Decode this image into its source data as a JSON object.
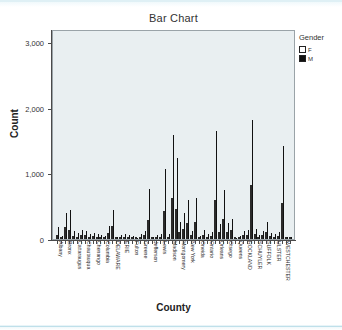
{
  "chart_data": {
    "type": "bar",
    "title": "Bar Chart",
    "xlabel": "County",
    "ylabel": "Count",
    "ylim": [
      0,
      3200
    ],
    "yticks": [
      "0",
      "1,000",
      "2,000",
      "3,000"
    ],
    "ytick_values": [
      0,
      1000,
      2000,
      3000
    ],
    "grid": false,
    "legend": {
      "title": "Gender",
      "position": "right",
      "entries": [
        {
          "label": "F",
          "color": "#ffffff"
        },
        {
          "label": "M",
          "color": "#111111"
        }
      ]
    },
    "categories": [
      "Albany",
      "Allegany",
      "Bronx",
      "Broome",
      "Cattaraugus",
      "Cayuga",
      "Chautauqua",
      "Chemung",
      "Chenango",
      "Clinton",
      "Columbia",
      "Cortland",
      "DELAWARE",
      "Dutchess",
      "ERIE",
      "Essex",
      "Franklin",
      "Fulton",
      "Genesee",
      "Greene",
      "Hamilton",
      "Herkimer",
      "Jefferson",
      "Kings",
      "Lewis",
      "Livingston",
      "Madison",
      "Monroe",
      "Montgomery",
      "Nassau",
      "New York",
      "Niagara",
      "Oneida",
      "Onondaga",
      "Ontario",
      "Orange",
      "Orleans",
      "Oswego",
      "Otsego",
      "Putnam",
      "Queens",
      "Rensselaer",
      "ROCKLAND",
      "Saratoga",
      "Schenectady",
      "SCHUYLER",
      "Seneca",
      "St Lawrence",
      "Steuben",
      "SUFFOLK",
      "Sullivan",
      "Tioga",
      "Tompkins",
      "ULSTER",
      "Warren",
      "Washington",
      "Wayne",
      "WESTCHESTER",
      "Wyoming",
      "Yates"
    ],
    "tick_labels": [
      "Albany",
      "Bronx",
      "Cattaraugus",
      "Chautauqua",
      "Chenango",
      "Columbia",
      "DELAWARE",
      "ERIE",
      "Fulton",
      "Greene",
      "Jefferson",
      "Lewis",
      "Madison",
      "Montgomery",
      "New York",
      "Oneida",
      "Ontario",
      "Orleans",
      "Otsego",
      "Queens",
      "ROCKLAND",
      "SCHUYLER",
      "SUFFOLK",
      "ULSTER",
      "WESTCHESTER"
    ],
    "series": [
      {
        "name": "F",
        "values": [
          60,
          20,
          180,
          130,
          45,
          35,
          60,
          55,
          30,
          40,
          30,
          25,
          20,
          95,
          200,
          15,
          25,
          30,
          25,
          20,
          5,
          30,
          55,
          290,
          10,
          25,
          30,
          430,
          35,
          620,
          460,
          110,
          160,
          250,
          55,
          260,
          20,
          60,
          30,
          45,
          600,
          100,
          300,
          110,
          130,
          8,
          20,
          55,
          60,
          830,
          70,
          25,
          55,
          110,
          40,
          30,
          45,
          550,
          15,
          12
        ]
      },
      {
        "name": "M",
        "values": [
          185,
          45,
          400,
          440,
          125,
          90,
          135,
          120,
          70,
          95,
          75,
          60,
          45,
          200,
          440,
          35,
          55,
          70,
          55,
          45,
          10,
          70,
          120,
          760,
          25,
          55,
          70,
          1060,
          80,
          1590,
          1230,
          255,
          400,
          600,
          120,
          620,
          45,
          140,
          70,
          105,
          1650,
          230,
          740,
          250,
          300,
          18,
          45,
          125,
          140,
          1810,
          160,
          55,
          125,
          255,
          90,
          70,
          105,
          1420,
          35,
          28
        ]
      }
    ],
    "peaks": [
      {
        "category": "Kings",
        "f": 290,
        "m": 760
      },
      {
        "category": "Nassau",
        "f": 620,
        "m": 1590
      },
      {
        "category": "New York",
        "f": 460,
        "m": 1230
      },
      {
        "category": "Queens",
        "f": 600,
        "m": 1650
      },
      {
        "category": "SUFFOLK",
        "f": 830,
        "m": 1810
      },
      {
        "category": "WESTCHESTER",
        "f": 550,
        "m": 1420
      },
      {
        "category": "Bronx",
        "f": 180,
        "m": 400
      }
    ]
  }
}
